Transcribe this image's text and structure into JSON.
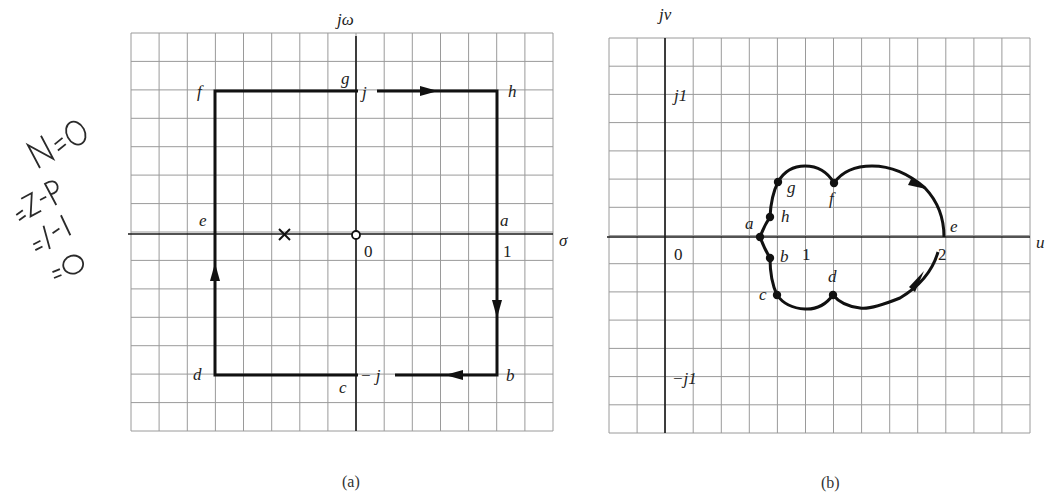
{
  "annotation": {
    "lines": [
      "N=0",
      "=Z-P",
      "=1-1",
      "=0"
    ]
  },
  "plot_a": {
    "caption": "(a)",
    "x_axis_label": "σ",
    "y_axis_label": "jω",
    "origin_label": "0",
    "tick_x_1": "1",
    "top_label": "j",
    "bottom_label": "− j",
    "points": {
      "a": "a",
      "b": "b",
      "c": "c",
      "d": "d",
      "e": "e",
      "f": "f",
      "g": "g",
      "h": "h"
    },
    "markers": [
      {
        "type": "pole",
        "symbol": "×",
        "sigma": -0.5,
        "omega": 0
      },
      {
        "type": "zero",
        "symbol": "o",
        "sigma": 0,
        "omega": 0
      }
    ],
    "contour_vertices": [
      {
        "point": "a",
        "sigma": 1,
        "omega": 0
      },
      {
        "point": "b",
        "sigma": 1,
        "omega": -1
      },
      {
        "point": "c",
        "sigma": 0,
        "omega": -1
      },
      {
        "point": "d",
        "sigma": -1,
        "omega": -1
      },
      {
        "point": "e",
        "sigma": -1,
        "omega": 0
      },
      {
        "point": "f",
        "sigma": -1,
        "omega": 1
      },
      {
        "point": "g",
        "sigma": 0,
        "omega": 1
      },
      {
        "point": "h",
        "sigma": 1,
        "omega": 1
      }
    ]
  },
  "plot_b": {
    "caption": "(b)",
    "x_axis_label": "u",
    "y_axis_label": "jv",
    "origin_label": "0",
    "tick_x_1": "1",
    "tick_x_2": "2",
    "tick_y_pos": "j1",
    "tick_y_neg": "−j1",
    "points": {
      "a": "a",
      "b": "b",
      "c": "c",
      "d": "d",
      "e": "e",
      "f": "f",
      "g": "g",
      "h": "h"
    },
    "mapped_points": [
      {
        "point": "a",
        "u": 0.68,
        "v": 0.0
      },
      {
        "point": "h",
        "u": 0.75,
        "v": 0.15
      },
      {
        "point": "g",
        "u": 0.8,
        "v": 0.39
      },
      {
        "point": "f",
        "u": 1.2,
        "v": 0.38
      },
      {
        "point": "e",
        "u": 2.0,
        "v": 0.0
      },
      {
        "point": "d",
        "u": 1.2,
        "v": -0.42
      },
      {
        "point": "c",
        "u": 0.8,
        "v": -0.42
      },
      {
        "point": "b",
        "u": 0.75,
        "v": -0.15
      }
    ]
  }
}
